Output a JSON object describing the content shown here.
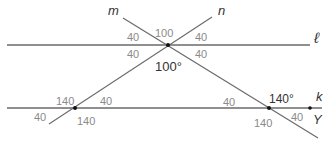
{
  "diagram": {
    "lines": {
      "l": {
        "name": "ℓ"
      },
      "k": {
        "name": "k"
      },
      "m": {
        "name": "m"
      },
      "n": {
        "name": "n"
      }
    },
    "point_label": "Y",
    "angles": {
      "top_mid_upper": "100",
      "top_left_upper": "40",
      "top_right_upper": "40",
      "top_left_lower": "40",
      "top_right_lower": "40",
      "top_mid_lower": "100°",
      "left_upper_left": "140",
      "left_upper_right": "40",
      "left_lower_left": "40",
      "left_lower_right": "140",
      "right_upper_left": "40",
      "right_upper_right": "140°",
      "right_lower_left": "140",
      "right_lower_right": "40"
    },
    "colors": {
      "line": "#666666",
      "label": "#8a8a8a",
      "point": "#111111"
    }
  }
}
